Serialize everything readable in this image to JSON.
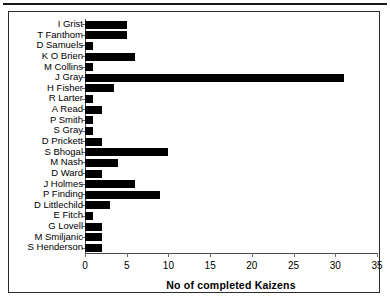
{
  "figure": {
    "border_color": "#2b2b2b",
    "background": "#ffffff",
    "bar_color": "#000000"
  },
  "chart_data": {
    "type": "bar",
    "orientation": "horizontal",
    "title": "",
    "subtitle": "",
    "xlabel": "No of completed Kaizens",
    "ylabel": "",
    "xlim": [
      0,
      35
    ],
    "xticks": [
      0,
      5,
      10,
      15,
      20,
      25,
      30,
      35
    ],
    "xtick_labels": [
      "0",
      "5",
      "10",
      "15",
      "20",
      "25",
      "30",
      "35"
    ],
    "grid": false,
    "legend": null,
    "categories": [
      "I Grist",
      "T Fanthom",
      "D Samuels",
      "K O Brien",
      "M Collins",
      "J Gray",
      "H Fisher",
      "R Larter",
      "A Read",
      "P Smith",
      "S Gray",
      "D Prickett",
      "S Bhogal",
      "M Nash",
      "D Ward",
      "J Holmes",
      "P Finding",
      "D Littlechild",
      "E Fitch",
      "G Lovell",
      "M Smiljanic",
      "S Henderson"
    ],
    "values": [
      5,
      5,
      1,
      6,
      1,
      31,
      3.5,
      1,
      2,
      1,
      1,
      2,
      10,
      4,
      2,
      6,
      9,
      3,
      1,
      2,
      2,
      2
    ]
  }
}
